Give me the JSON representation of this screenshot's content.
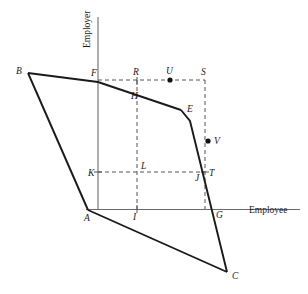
{
  "figure": {
    "width": 308,
    "height": 294,
    "background": "#ffffff",
    "line_color": "#1a1a1a",
    "axis_color": "#6b6b6b",
    "dash_color": "#555555"
  },
  "axes": {
    "y_axis_label": "Employer",
    "x_axis_label": "Employee",
    "y_axis_label_pos": {
      "x": 90,
      "y": 48
    },
    "x_axis_label_pos": {
      "x": 249,
      "y": 213
    },
    "y_axis": {
      "x": 98,
      "y1": 17,
      "y2": 210
    },
    "x_axis": {
      "y": 209.5,
      "x1": 86,
      "x2": 300
    }
  },
  "vertices": {
    "A": {
      "x": 88,
      "y": 210,
      "label": "A",
      "lx": 84,
      "ly": 221,
      "dot": false
    },
    "B": {
      "x": 28,
      "y": 73,
      "label": "B",
      "lx": 16,
      "ly": 74,
      "dot": false
    },
    "C": {
      "x": 227,
      "y": 272,
      "label": "C",
      "lx": 232,
      "ly": 279,
      "dot": false
    },
    "E": {
      "x": 181,
      "y": 110,
      "label": "E",
      "lx": 187,
      "ly": 112,
      "dot": false
    },
    "F": {
      "x": 98,
      "y": 80,
      "label": "F",
      "lx": 91,
      "ly": 76,
      "dot": false
    },
    "G": {
      "x": 212,
      "y": 209,
      "label": "G",
      "lx": 216,
      "ly": 218,
      "dot": false
    },
    "H": {
      "x": 137,
      "y": 91,
      "label": "H",
      "lx": 131,
      "ly": 99,
      "dot": false
    },
    "I": {
      "x": 137,
      "y": 209,
      "label": "I",
      "lx": 133,
      "ly": 220,
      "dot": false
    },
    "J": {
      "x": 201,
      "y": 172,
      "label": "J",
      "lx": 196,
      "ly": 181,
      "dot": false
    },
    "K": {
      "x": 98,
      "y": 172,
      "label": "K",
      "lx": 89,
      "ly": 175,
      "dot": false
    },
    "L": {
      "x": 137,
      "y": 172,
      "label": "L",
      "lx": 141,
      "ly": 169,
      "dot": false
    },
    "R": {
      "x": 137,
      "y": 80,
      "label": "R",
      "lx": 133,
      "ly": 74,
      "dot": false
    },
    "S": {
      "x": 205,
      "y": 80,
      "label": "S",
      "lx": 202,
      "ly": 74,
      "dot": false
    },
    "T": {
      "x": 205,
      "y": 172,
      "label": "T",
      "lx": 209,
      "ly": 175,
      "dot": false
    },
    "U": {
      "x": 170,
      "y": 80,
      "label": "U",
      "lx": 166,
      "ly": 74,
      "dot": true
    },
    "V": {
      "x": 208,
      "y": 141,
      "label": "V",
      "lx": 214,
      "ly": 142,
      "dot": true
    }
  },
  "solid_paths": [
    {
      "name": "boundary-B-F-E",
      "points": "28,73 98,82 181,110"
    },
    {
      "name": "boundary-E-G-C",
      "points": "181,110 190,121 227,272"
    },
    {
      "name": "boundary-C-A",
      "points": "227,272 88,210"
    },
    {
      "name": "boundary-A-B",
      "points": "88,210 28,73"
    }
  ],
  "dashed_paths": [
    {
      "name": "top-dash-F-S",
      "points": "98,80 205,80"
    },
    {
      "name": "mid-dash-K-T",
      "points": "98,172 205,172"
    },
    {
      "name": "vert-dash-R-I",
      "points": "137,80 137,209"
    },
    {
      "name": "vert-dash-S-G",
      "points": "205,80 205,209"
    }
  ],
  "labels_legend": {
    "point_U_name": "U",
    "point_V_name": "V",
    "note": "U and V are marked interior points"
  }
}
